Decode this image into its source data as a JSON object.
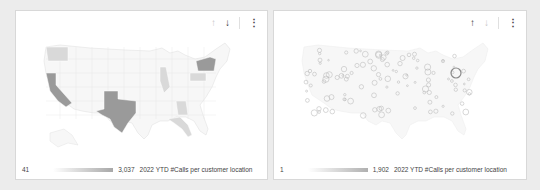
{
  "panels": [
    {
      "id": "left",
      "type": "filled-map",
      "toolbar": {
        "up_icon": "↑",
        "down_icon": "↓",
        "more_icon": "⋮",
        "active": "down"
      },
      "legend": {
        "min": "41",
        "max": "3,037",
        "title": "2022 YTD #Calls per customer location"
      },
      "colors": {
        "low": "#f7f7f7",
        "mid": "#d9d9d9",
        "high": "#9a9a9a",
        "border": "#e2e2e2"
      },
      "highlighted_states": [
        {
          "name": "Texas",
          "level": "high"
        },
        {
          "name": "California",
          "level": "high"
        },
        {
          "name": "New York",
          "level": "high"
        },
        {
          "name": "Florida",
          "level": "mid"
        },
        {
          "name": "Washington",
          "level": "mid"
        },
        {
          "name": "Illinois",
          "level": "mid"
        },
        {
          "name": "Pennsylvania",
          "level": "mid"
        },
        {
          "name": "Georgia",
          "level": "mid"
        }
      ]
    },
    {
      "id": "right",
      "type": "bubble-map",
      "toolbar": {
        "up_icon": "↑",
        "down_icon": "↓",
        "more_icon": "⋮",
        "active": "up"
      },
      "legend": {
        "min": "1",
        "max": "1,902",
        "title": "2022 YTD #Calls per customer location"
      },
      "colors": {
        "bubble": "#bdbdbd",
        "land": "#f7f7f7",
        "border": "#eeeeee"
      }
    }
  ]
}
